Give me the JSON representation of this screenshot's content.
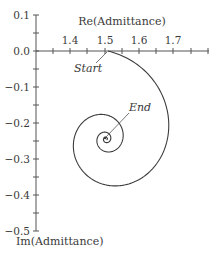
{
  "chart_data": {
    "type": "line",
    "title": "",
    "xlabel": "Re(Admittance)",
    "ylabel": "Im(Admittance)",
    "xlim": [
      1.3,
      1.78
    ],
    "ylim": [
      -0.5,
      0.1
    ],
    "grid": false,
    "legend": null,
    "x_ticks": [
      1.4,
      1.5,
      1.6,
      1.7
    ],
    "x_minor_ticks": [
      1.35,
      1.4,
      1.45,
      1.5,
      1.55,
      1.6,
      1.65,
      1.7,
      1.75
    ],
    "y_ticks": [
      "0.1",
      "0.0",
      "−0.1",
      "−0.2",
      "−0.3",
      "−0.4",
      "−0.5"
    ],
    "y_tick_values": [
      0.1,
      0.0,
      -0.1,
      -0.2,
      -0.3,
      -0.4,
      -0.5
    ],
    "series": [
      {
        "name": "Admittance locus (inward spiral)",
        "shape": "clockwise spiral converging to center",
        "start": {
          "x": 1.51,
          "y": 0.0
        },
        "end": {
          "x": 1.5,
          "y": -0.25
        },
        "outer_loop_extent": {
          "x_min": 1.38,
          "x_max": 1.72,
          "y_min": -0.41,
          "y_max": 0.0
        },
        "second_loop_extent": {
          "x_min": 1.43,
          "x_max": 1.57,
          "y_min": -0.3,
          "y_max": -0.15
        },
        "center": {
          "x": 1.5,
          "y": -0.25
        }
      }
    ],
    "annotations": [
      {
        "text": "Start",
        "x": 1.51,
        "y": 0.0
      },
      {
        "text": "End",
        "x": 1.5,
        "y": -0.25
      }
    ]
  },
  "labels": {
    "x_axis_title": "Re(Admittance)",
    "y_axis_title": "Im(Admittance)",
    "start": "Start",
    "end": "End",
    "x_tick_1": "1.4",
    "x_tick_2": "1.5",
    "x_tick_3": "1.6",
    "x_tick_4": "1.7",
    "y_tick_0": "0.1",
    "y_tick_1": "0.0",
    "y_tick_2": "−0.1",
    "y_tick_3": "−0.2",
    "y_tick_4": "−0.3",
    "y_tick_5": "−0.4",
    "y_tick_6": "−0.5"
  }
}
